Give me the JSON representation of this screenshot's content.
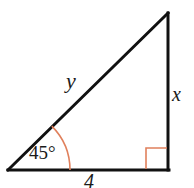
{
  "figure": {
    "type": "right-triangle-diagram",
    "width": 194,
    "height": 188,
    "background_color": "#ffffff",
    "stroke_color": "#111111",
    "stroke_width": 3,
    "marker_color": "#E0805C",
    "marker_width": 1.6,
    "vertices": {
      "left": {
        "x": 8,
        "y": 170
      },
      "top_right": {
        "x": 168,
        "y": 13
      },
      "bottom_right": {
        "x": 168,
        "y": 170
      }
    },
    "angle_arc": {
      "center": {
        "x": 8,
        "y": 170
      },
      "radius": 62,
      "start_deg": 0,
      "end_deg": 45
    },
    "right_angle_marker": {
      "x": 146,
      "y": 148,
      "size": 22
    },
    "labels": {
      "hypotenuse": "y",
      "vertical_leg": "x",
      "angle": "45°",
      "base": "4"
    }
  }
}
